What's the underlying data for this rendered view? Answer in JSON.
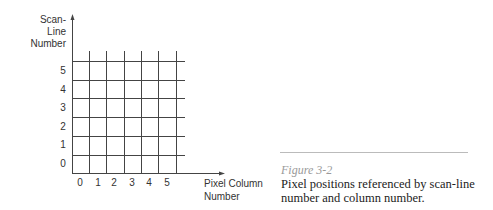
{
  "diagram": {
    "y_axis_label": [
      "Scan-",
      "Line",
      "Number"
    ],
    "x_axis_label": [
      "Pixel Column",
      "Number"
    ],
    "row_labels": [
      "0",
      "1",
      "2",
      "3",
      "4",
      "5"
    ],
    "column_labels": [
      "0",
      "1",
      "2",
      "3",
      "4",
      "5"
    ],
    "line_color": "#444444"
  },
  "figure": {
    "number": "Figure 3-2",
    "caption": "Pixel positions referenced by scan-line number and column number."
  }
}
